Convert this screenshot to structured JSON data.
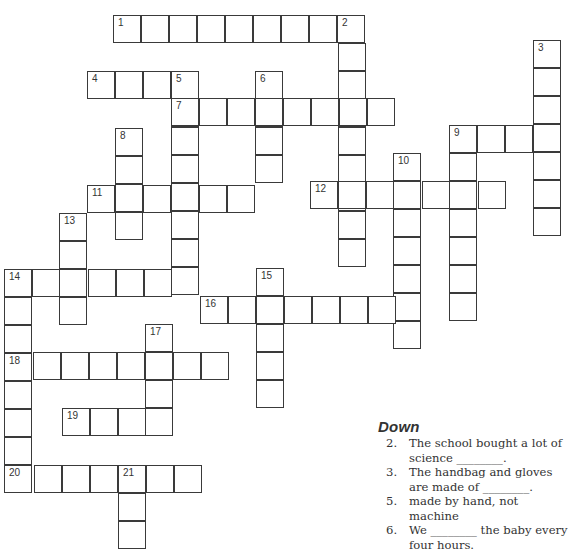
{
  "puzzle": {
    "type": "crossword",
    "numbers": [
      "1",
      "2",
      "3",
      "4",
      "5",
      "7",
      "6",
      "8",
      "9",
      "10",
      "11",
      "12",
      "13",
      "14",
      "15",
      "16",
      "17",
      "18",
      "19",
      "20",
      "21"
    ],
    "entries": [
      {
        "number": "1",
        "direction": "across",
        "length": 9
      },
      {
        "number": "2",
        "direction": "down",
        "length": 9
      },
      {
        "number": "3",
        "direction": "down",
        "length": 7
      },
      {
        "number": "4",
        "direction": "across",
        "length": 4
      },
      {
        "number": "5",
        "direction": "down",
        "length": 8
      },
      {
        "number": "6",
        "direction": "down",
        "length": 4
      },
      {
        "number": "7",
        "direction": "across",
        "length": 8
      },
      {
        "number": "8",
        "direction": "down",
        "length": 4
      },
      {
        "number": "9",
        "direction": "across",
        "length": 4
      },
      {
        "number": "9",
        "direction": "down",
        "length": 7
      },
      {
        "number": "10",
        "direction": "down",
        "length": 7
      },
      {
        "number": "11",
        "direction": "across",
        "length": 6
      },
      {
        "number": "12",
        "direction": "across",
        "length": 7
      },
      {
        "number": "13",
        "direction": "down",
        "length": 4
      },
      {
        "number": "14",
        "direction": "across",
        "length": 7
      },
      {
        "number": "14",
        "direction": "down",
        "length": 8
      },
      {
        "number": "15",
        "direction": "down",
        "length": 5
      },
      {
        "number": "16",
        "direction": "across",
        "length": 8
      },
      {
        "number": "17",
        "direction": "down",
        "length": 4
      },
      {
        "number": "18",
        "direction": "across",
        "length": 8
      },
      {
        "number": "19",
        "direction": "across",
        "length": 4
      },
      {
        "number": "20",
        "direction": "across",
        "length": 7
      },
      {
        "number": "21",
        "direction": "down",
        "length": 3
      }
    ]
  },
  "clues": {
    "down_heading": "Down",
    "down": [
      {
        "number": "2.",
        "text": "The school bought a lot of science ________."
      },
      {
        "number": "3.",
        "text": "The handbag and gloves are made of ________."
      },
      {
        "number": "5.",
        "text": "made by hand, not machine"
      },
      {
        "number": "6.",
        "text": "We ________ the baby every four hours."
      }
    ]
  }
}
